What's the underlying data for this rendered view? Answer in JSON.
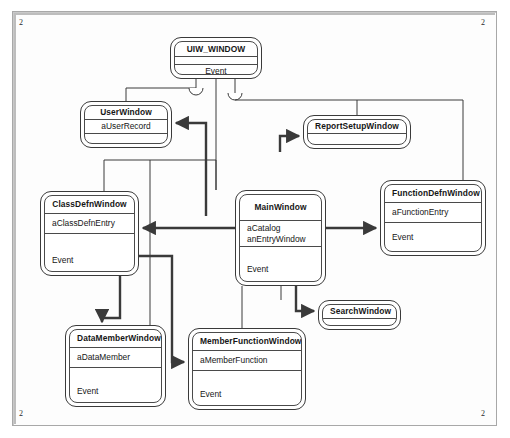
{
  "diagram": {
    "type": "uml-class-diagram",
    "page_marks": {
      "top_left": "2",
      "top_right": "2",
      "bottom_left": "2",
      "bottom_right": "2"
    },
    "colors": {
      "line": "#3a3a3a",
      "background": "#ffffff",
      "frame": "#a8a8a8"
    },
    "nodes": [
      {
        "id": "uiw_window",
        "name": "UIW_WINDOW",
        "attributes": [],
        "operations": [
          "Event"
        ],
        "x": 170,
        "y": 37,
        "w": 92,
        "h": 42
      },
      {
        "id": "user_window",
        "name": "UserWindow",
        "attributes": [
          "aUserRecord"
        ],
        "operations": [],
        "x": 80,
        "y": 101,
        "w": 92,
        "h": 47
      },
      {
        "id": "report_setup_window",
        "name": "ReportSetupWindow",
        "attributes": [],
        "operations": [],
        "x": 303,
        "y": 115,
        "w": 108,
        "h": 34
      },
      {
        "id": "class_defn_window",
        "name": "ClassDefnWindow",
        "attributes": [
          "aClassDefnEntry"
        ],
        "operations": [
          "Event"
        ],
        "x": 40,
        "y": 191,
        "w": 99,
        "h": 85
      },
      {
        "id": "main_window",
        "name": "MainWindow",
        "attributes": [
          "aCatalog",
          "anEntryWindow"
        ],
        "operations": [
          "Event"
        ],
        "x": 235,
        "y": 190,
        "w": 91,
        "h": 96
      },
      {
        "id": "function_defn_window",
        "name": "FunctionDefnWindow",
        "attributes": [
          "aFunctionEntry"
        ],
        "operations": [
          "Event"
        ],
        "x": 380,
        "y": 180,
        "w": 106,
        "h": 76
      },
      {
        "id": "search_window",
        "name": "SearchWindow",
        "attributes": [],
        "operations": [],
        "x": 318,
        "y": 300,
        "w": 83,
        "h": 30
      },
      {
        "id": "data_member_window",
        "name": "DataMemberWindow",
        "attributes": [
          "aDataMember"
        ],
        "operations": [
          "Event"
        ],
        "x": 65,
        "y": 325,
        "w": 101,
        "h": 82
      },
      {
        "id": "member_function_window",
        "name": "MemberFunctionWindow",
        "attributes": [
          "aMemberFunction"
        ],
        "operations": [
          "Event"
        ],
        "x": 188,
        "y": 328,
        "w": 118,
        "h": 82
      }
    ],
    "relations": [
      {
        "kind": "generalization",
        "from": "user_window",
        "to": "uiw_window"
      },
      {
        "kind": "generalization",
        "from": "main_window",
        "to": "uiw_window"
      },
      {
        "kind": "generalization",
        "from": "report_setup_window",
        "to": "uiw_window"
      },
      {
        "kind": "generalization",
        "from": "class_defn_window",
        "to": "uiw_window"
      },
      {
        "kind": "generalization",
        "from": "function_defn_window",
        "to": "uiw_window"
      },
      {
        "kind": "generalization",
        "from": "search_window",
        "to": "uiw_window"
      },
      {
        "kind": "generalization",
        "from": "data_member_window",
        "to": "uiw_window"
      },
      {
        "kind": "generalization",
        "from": "member_function_window",
        "to": "uiw_window"
      },
      {
        "kind": "association",
        "from": "main_window",
        "to": "class_defn_window"
      },
      {
        "kind": "association",
        "from": "main_window",
        "to": "function_defn_window"
      },
      {
        "kind": "association",
        "from": "main_window",
        "to": "search_window"
      },
      {
        "kind": "association",
        "from": "main_window",
        "to": "user_window"
      },
      {
        "kind": "association",
        "from": "main_window",
        "to": "report_setup_window"
      },
      {
        "kind": "association",
        "from": "class_defn_window",
        "to": "data_member_window"
      },
      {
        "kind": "association",
        "from": "class_defn_window",
        "to": "member_function_window"
      }
    ]
  }
}
